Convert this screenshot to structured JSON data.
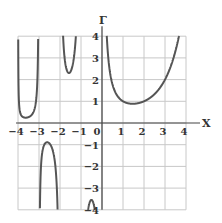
{
  "chart_data": {
    "type": "line",
    "title": "",
    "xlabel": "X",
    "ylabel": "Γ",
    "xlim": [
      -4,
      4
    ],
    "ylim": [
      -4,
      4
    ],
    "grid": true,
    "x_ticks": [
      "-4",
      "-3",
      "-2",
      "-1",
      "0",
      "1",
      "2",
      "3",
      "4"
    ],
    "y_ticks": [
      "4",
      "3",
      "2",
      "1",
      "-1",
      "-2",
      "-3",
      "-4"
    ],
    "function": "Gamma(x)",
    "series": [
      {
        "name": "Γ(x) on (-4,-3)",
        "x": [
          -3.95,
          -3.8,
          -3.64,
          -3.4,
          -3.2,
          -3.05
        ],
        "values": [
          4.0,
          0.8,
          0.39,
          0.55,
          1.4,
          4.0
        ]
      },
      {
        "name": "Γ(x) on (-3,-2)",
        "x": [
          -2.97,
          -2.8,
          -2.5,
          -2.2,
          -2.03
        ],
        "values": [
          -4.0,
          -1.6,
          -0.95,
          -1.5,
          -4.0
        ]
      },
      {
        "name": "Γ(x) on (-2,-1)",
        "x": [
          -1.85,
          -1.7,
          -1.5,
          -1.3,
          -1.17
        ],
        "values": [
          4.0,
          2.9,
          2.36,
          2.9,
          4.0
        ]
      },
      {
        "name": "Γ(x) on (-1,0)",
        "x": [
          -0.8,
          -0.5,
          -0.2
        ],
        "values": [
          -4.0,
          -3.54,
          -4.0
        ]
      },
      {
        "name": "Γ(x) on (0,4)",
        "x": [
          0.22,
          0.5,
          1.0,
          1.46,
          2.0,
          3.0,
          3.6
        ],
        "values": [
          4.0,
          1.77,
          1.0,
          0.886,
          1.0,
          2.0,
          4.0
        ]
      }
    ]
  },
  "labels": {
    "x_axis": "X",
    "y_axis": "Γ",
    "origin": "0"
  }
}
